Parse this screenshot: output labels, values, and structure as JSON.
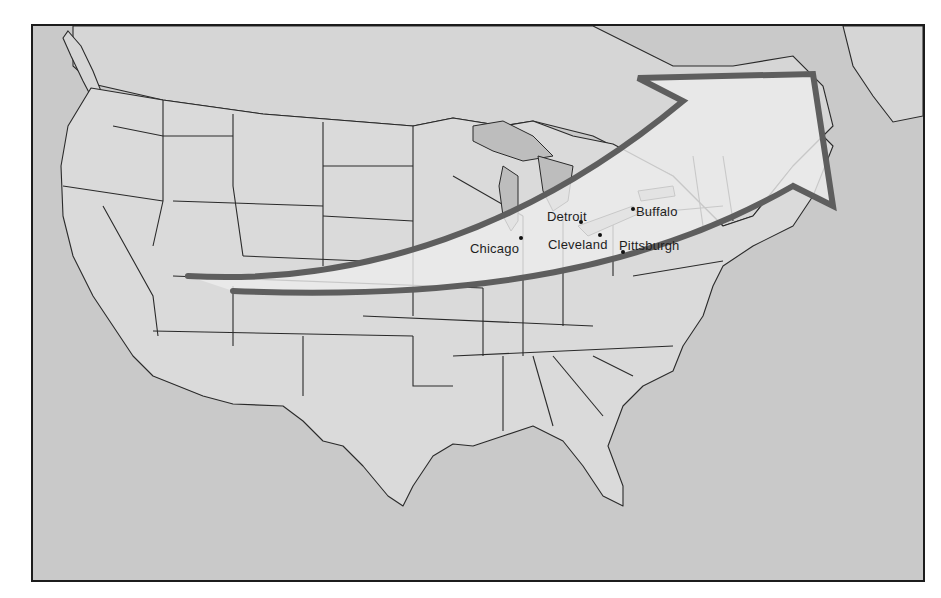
{
  "map": {
    "type": "regional-map",
    "region": "United States and southern Canada",
    "style": "grayscale outline map with state boundaries",
    "colors": {
      "background_water": "#c9c9c9",
      "land": "#dadada",
      "lakes": "#bdbdbd",
      "arrow_outline": "#5e5e5e",
      "arrow_fill": "#ececec",
      "frame": "#1c1c1c"
    },
    "arrow": {
      "description": "curved arrow from Colorado northeast across the Midwest and Great Lakes to New England / Atlantic Canada",
      "origin": "Colorado",
      "destination": "New England / Maritimes"
    },
    "cities": [
      {
        "name": "Detroit",
        "label": "Detroit"
      },
      {
        "name": "Buffalo",
        "label": "Buffalo"
      },
      {
        "name": "Chicago",
        "label": "Chicago"
      },
      {
        "name": "Cleveland",
        "label": "Cleveland"
      },
      {
        "name": "Pittsburgh",
        "label": "Pittsburgh"
      }
    ]
  }
}
